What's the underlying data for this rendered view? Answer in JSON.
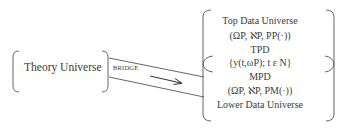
{
  "diagram": {
    "theory_universe": {
      "label": "Theory Universe"
    },
    "bridge": {
      "label": "BRIDGE",
      "arrow_direction": "right"
    },
    "data_universe": {
      "lines": [
        {
          "id": "top-data-universe",
          "text": "Top Data Universe"
        },
        {
          "id": "top-triple",
          "text": "(ΩP, ℵP, PP(·))"
        },
        {
          "id": "tpd",
          "text": "TPD"
        },
        {
          "id": "sequence",
          "text": "{y(t,ωP); t ε N}"
        },
        {
          "id": "mpd",
          "text": "MPD"
        },
        {
          "id": "lower-triple",
          "text": "(ΩP, ℵP, PM(·))"
        },
        {
          "id": "lower-data-universe",
          "text": "Lower Data Universe"
        }
      ]
    },
    "stroke_color": "#555555",
    "text_color": "#3a3a3a"
  }
}
